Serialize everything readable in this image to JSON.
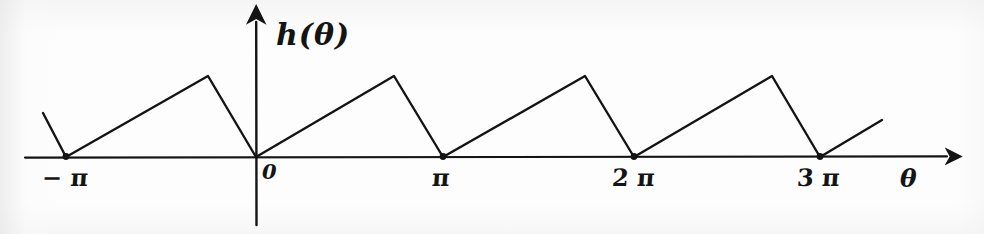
{
  "figure": {
    "kind": "hand-drawn-graph",
    "background_color": "#fdfdfd",
    "ink_color": "#141414"
  },
  "axes": {
    "y_axis_label": "h(θ)",
    "x_axis_label": "θ",
    "origin_label": "0",
    "x_axis_y_px": 157,
    "y_axis_x_px": 256,
    "tick_labels": [
      {
        "name": "neg-pi",
        "text": "− π",
        "x_px": 66
      },
      {
        "name": "pi",
        "text": "π",
        "x_px": 443
      },
      {
        "name": "2pi",
        "text": "2 π",
        "x_px": 634
      },
      {
        "name": "3pi",
        "text": "3 π",
        "x_px": 820
      }
    ]
  },
  "chart_data": {
    "type": "line",
    "title": "",
    "subtitle": "",
    "xlabel": "θ",
    "ylabel": "h(θ)",
    "grid": false,
    "legend": null,
    "waveform": "sawtooth",
    "period": "2π",
    "amplitude": 1,
    "xlim": [
      "-1.45π",
      "3.74π"
    ],
    "ylim": [
      0,
      1.25
    ],
    "zero_crossings": {
      "labels": [
        "-π",
        "0",
        "π",
        "2π",
        "3π"
      ],
      "x_px": [
        66,
        256,
        443,
        634,
        820
      ],
      "y_px": 157,
      "marked_with_dot": true
    },
    "peaks": {
      "x_px": [
        208,
        394,
        585,
        772
      ],
      "y_px": [
        76,
        76,
        76,
        76
      ],
      "value": 1
    },
    "polyline_px": [
      [
        43,
        113
      ],
      [
        66,
        157
      ],
      [
        208,
        76
      ],
      [
        256,
        157
      ],
      [
        394,
        76
      ],
      [
        443,
        157
      ],
      [
        585,
        76
      ],
      [
        634,
        157
      ],
      [
        772,
        76
      ],
      [
        820,
        157
      ],
      [
        882,
        120
      ]
    ],
    "x_axis_extent_px": [
      25,
      955
    ],
    "y_axis_extent_px": [
      14,
      225
    ]
  }
}
